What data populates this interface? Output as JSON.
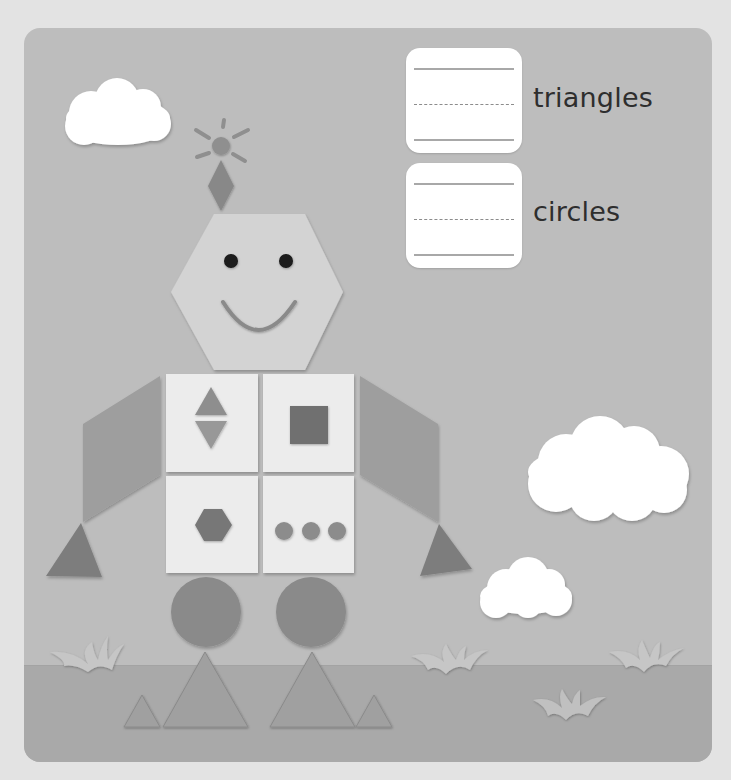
{
  "worksheet": {
    "questions": [
      {
        "label": "triangles",
        "answer_value": "",
        "answer_placeholder": ""
      },
      {
        "label": "circles",
        "answer_value": "",
        "answer_placeholder": ""
      }
    ]
  },
  "colors": {
    "page_background": "#e3e3e3",
    "sky": "#bdbdbd",
    "ground": "#a9a9a9",
    "cloud": "#ffffff",
    "grass": "#bcbcbc",
    "head": "#d3d3d3",
    "tile": "#ececec",
    "arm": "#9e9e9e",
    "hand": "#7d7d7d",
    "leg_circle": "#8a8a8a",
    "foot": "#a0a0a0",
    "eye": "#1a1a1a",
    "antenna": "#8f8f8f",
    "tile_triangle": "#8e8e8e",
    "tile_square": "#6f6f6f",
    "tile_hexagon": "#777777",
    "tile_circle": "#8c8c8c",
    "label_text": "#2e2e2e"
  },
  "scene": {
    "shapes_in_robot": [
      "diamond",
      "circle",
      "hexagon",
      "triangle",
      "triangle",
      "square",
      "hexagon",
      "circle",
      "circle",
      "circle",
      "parallelogram",
      "parallelogram",
      "triangle",
      "triangle",
      "circle",
      "circle",
      "triangle",
      "triangle",
      "triangle",
      "triangle"
    ]
  }
}
